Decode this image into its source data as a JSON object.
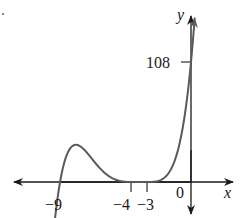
{
  "chart_data": {
    "type": "line",
    "title": "",
    "xlabel": "x",
    "ylabel": "y",
    "function_form": "y = (x+9)(x+4)^2(x+3)^2 / 12",
    "x_ticks": [
      {
        "value": -9,
        "label": "−9"
      },
      {
        "value": -4,
        "label": "−4"
      },
      {
        "value": -3,
        "label": "−3"
      },
      {
        "value": 0,
        "label": "0"
      }
    ],
    "y_ticks": [
      {
        "value": 108,
        "label": "108"
      }
    ],
    "x_intercepts": [
      -9,
      -4,
      -3
    ],
    "y_intercept": 108,
    "xlim": [
      -12,
      3
    ],
    "ylim": [
      -25,
      150
    ],
    "grid": false,
    "legend": null,
    "series": [
      {
        "name": "polynomial",
        "x": [
          -9.3,
          -9,
          -8.5,
          -8,
          -7.5,
          -7,
          -6.5,
          -6,
          -5.5,
          -5,
          -4.5,
          -4,
          -3.5,
          -3,
          -2.5,
          -2,
          -1.5,
          -1,
          -0.5,
          0,
          0.3
        ],
        "values": [
          -2.6,
          0,
          7.0,
          16.7,
          23.8,
          26.7,
          24.9,
          19.3,
          11.8,
          5.3,
          1.1,
          0,
          0.2,
          0,
          0.7,
          5.3,
          17.8,
          43.5,
          84.2,
          108,
          180
        ]
      }
    ]
  },
  "labels": {
    "x_axis": "x",
    "y_axis": "y",
    "tick_108": "108",
    "tick_neg9": "−9",
    "tick_neg4": "−4",
    "tick_neg3": "−3",
    "origin": "0"
  },
  "colors": {
    "axis": "#1a1a1a",
    "curve": "#5a5a5a"
  }
}
